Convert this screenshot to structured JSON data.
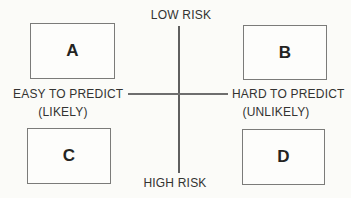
{
  "diagram_title": "risk-predictability-matrix",
  "colors": {
    "background": "#fbfbf8",
    "axis_line": "#5f5f5f",
    "box_border": "#7b7b79",
    "box_fill": "#fdfdfb",
    "label_text": "#333331",
    "box_letter": "#242422"
  },
  "axes": {
    "top_label": "LOW RISK",
    "bottom_label": "HIGH RISK",
    "left_label": "EASY TO PREDICT",
    "left_sublabel": "(LIKELY)",
    "right_label": "HARD TO PREDICT",
    "right_sublabel": "(UNLIKELY)"
  },
  "quadrants": [
    {
      "label": "A",
      "position": "top-left"
    },
    {
      "label": "B",
      "position": "top-right"
    },
    {
      "label": "C",
      "position": "bottom-left"
    },
    {
      "label": "D",
      "position": "bottom-right"
    }
  ]
}
